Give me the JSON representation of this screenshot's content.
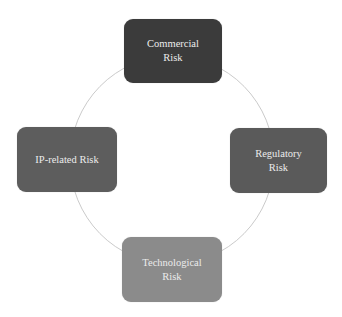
{
  "diagram": {
    "type": "cycle",
    "ring": {
      "cx": 172,
      "cy": 160,
      "rx": 102,
      "ry": 104,
      "stroke": "#c4c4c4"
    },
    "nodes": [
      {
        "id": "commercial",
        "label": "Commercial\nRisk",
        "color": "#3b3b3b",
        "position": "top"
      },
      {
        "id": "regulatory",
        "label": "Regulatory\nRisk",
        "color": "#5a5a5a",
        "position": "right"
      },
      {
        "id": "technological",
        "label": "Technological\nRisk",
        "color": "#8b8b8b",
        "position": "bottom"
      },
      {
        "id": "ip",
        "label": "IP-related Risk",
        "color": "#5d5d5d",
        "position": "left"
      }
    ]
  }
}
